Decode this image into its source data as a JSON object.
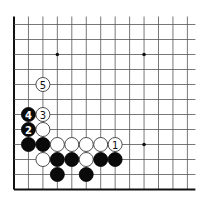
{
  "diagram": {
    "type": "go-board-fragment",
    "columns": 13,
    "rows": 12,
    "origin_x": 14,
    "bottom_y": 189.5,
    "spacing_x": 14.45,
    "spacing_y": 15,
    "line_extend_top": 8,
    "line_extend_right": 8,
    "edges": [
      "left",
      "bottom"
    ],
    "stone_radius": 7,
    "star_points": [
      {
        "col": 3,
        "row": 9
      },
      {
        "col": 9,
        "row": 9
      },
      {
        "col": 9,
        "row": 3
      }
    ],
    "stones": [
      {
        "col": 1,
        "row": 3,
        "color": "black",
        "label": ""
      },
      {
        "col": 2,
        "row": 3,
        "color": "black",
        "label": ""
      },
      {
        "col": 3,
        "row": 3,
        "color": "white",
        "label": ""
      },
      {
        "col": 4,
        "row": 3,
        "color": "white",
        "label": ""
      },
      {
        "col": 5,
        "row": 3,
        "color": "white",
        "label": ""
      },
      {
        "col": 6,
        "row": 3,
        "color": "white",
        "label": ""
      },
      {
        "col": 7,
        "row": 3,
        "color": "white",
        "label": "1"
      },
      {
        "col": 2,
        "row": 2,
        "color": "white",
        "label": ""
      },
      {
        "col": 3,
        "row": 2,
        "color": "black",
        "label": ""
      },
      {
        "col": 4,
        "row": 2,
        "color": "black",
        "label": ""
      },
      {
        "col": 5,
        "row": 2,
        "color": "white",
        "label": ""
      },
      {
        "col": 6,
        "row": 2,
        "color": "black",
        "label": ""
      },
      {
        "col": 7,
        "row": 2,
        "color": "black",
        "label": ""
      },
      {
        "col": 3,
        "row": 1,
        "color": "black",
        "label": ""
      },
      {
        "col": 5,
        "row": 1,
        "color": "black",
        "label": ""
      },
      {
        "col": 1,
        "row": 4,
        "color": "black",
        "label": "2"
      },
      {
        "col": 2,
        "row": 4,
        "color": "white",
        "label": ""
      },
      {
        "col": 1,
        "row": 5,
        "color": "black",
        "label": "4"
      },
      {
        "col": 2,
        "row": 5,
        "color": "white",
        "label": "3"
      },
      {
        "col": 2,
        "row": 7,
        "color": "white",
        "label": "5"
      }
    ]
  }
}
